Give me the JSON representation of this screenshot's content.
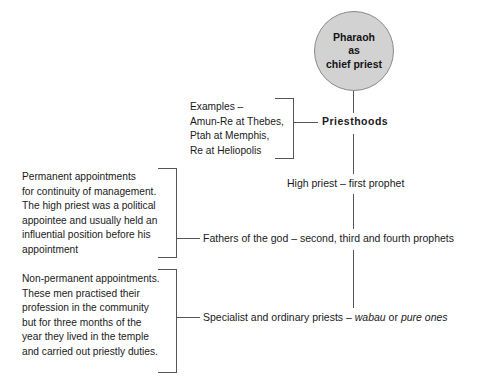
{
  "diagram": {
    "colors": {
      "circle_fill": "#d2d2d2",
      "circle_stroke": "#8a8a8a",
      "connector": "#555555",
      "text": "#1a1a1a",
      "background": "#ffffff"
    },
    "root": {
      "lines": [
        "Pharaoh",
        "as",
        "chief priest"
      ]
    },
    "spine_nodes": [
      {
        "id": "priesthoods",
        "label": "Priesthoods",
        "bold": true
      },
      {
        "id": "high-priest",
        "label": "High priest –  first prophet",
        "bold": false
      },
      {
        "id": "fathers",
        "label": "Fathers of the god – second, third and fourth prophets",
        "bold": false
      },
      {
        "id": "specialist",
        "label_before": "Specialist and ordinary priests – ",
        "label_italic_1": "wabau",
        "label_mid": " or ",
        "label_italic_2": "pure ones"
      }
    ],
    "annotations": [
      {
        "id": "examples",
        "lines": [
          "Examples –",
          "Amun-Re at Thebes,",
          "Ptah at Memphis,",
          "Re at Heliopolis"
        ]
      },
      {
        "id": "permanent",
        "lines": [
          "Permanent appointments",
          "for continuity of management.",
          "The high priest was a political",
          "appointee and usually held an",
          "influential position before his",
          "appointment"
        ]
      },
      {
        "id": "non-permanent",
        "lines": [
          "Non-permanent appointments.",
          "These men practised their",
          "profession in the community",
          "but for three months of the",
          "year they lived in the temple",
          "and carried out priestly duties."
        ]
      }
    ]
  }
}
